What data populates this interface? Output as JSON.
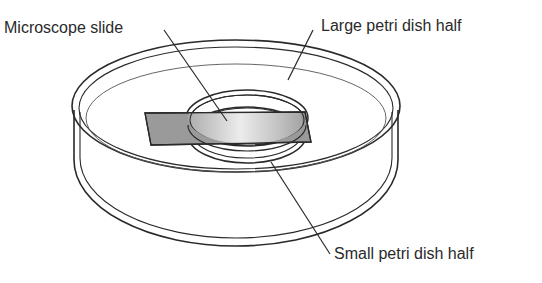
{
  "diagram": {
    "type": "labeled-illustration",
    "labels": {
      "microscope_slide": "Microscope slide",
      "large_petri_dish_half": "Large petri dish half",
      "small_petri_dish_half": "Small petri dish half"
    },
    "colors": {
      "line": "#2a2a2a",
      "slide_fill": "#9a9a9a",
      "slide_highlight": "#e6e6e6",
      "background": "#ffffff"
    }
  }
}
